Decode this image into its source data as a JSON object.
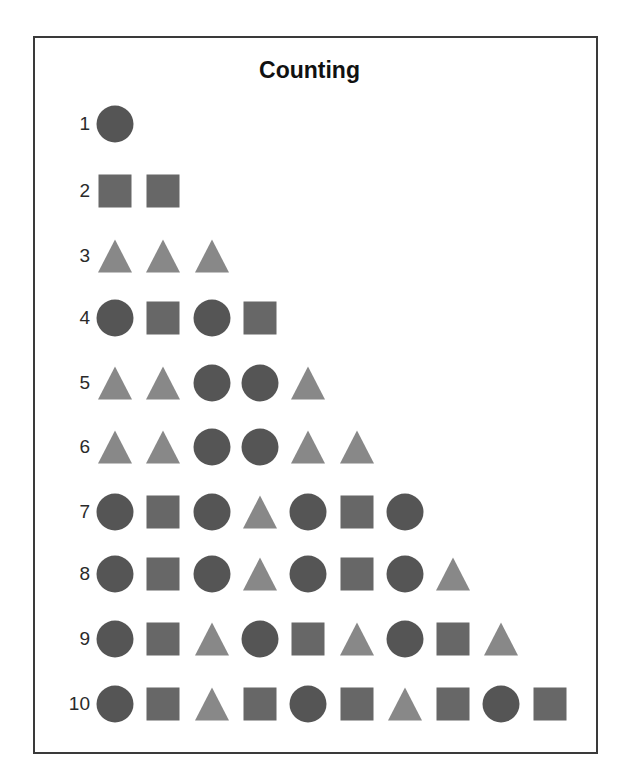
{
  "title": "Counting",
  "colors": {
    "circle": "#555555",
    "square": "#676767",
    "triangle": "#888888",
    "border": "#3a3a3a",
    "text": "#2a2a2a"
  },
  "layout": {
    "first_col_center_x": 115,
    "col_pitch": 48.3,
    "row_centers_y": [
      124,
      191,
      256,
      318,
      383,
      447,
      512,
      574,
      639,
      704
    ]
  },
  "rows": [
    {
      "label": "1",
      "shapes": [
        "circle"
      ]
    },
    {
      "label": "2",
      "shapes": [
        "square",
        "square"
      ]
    },
    {
      "label": "3",
      "shapes": [
        "triangle",
        "triangle",
        "triangle"
      ]
    },
    {
      "label": "4",
      "shapes": [
        "circle",
        "square",
        "circle",
        "square"
      ]
    },
    {
      "label": "5",
      "shapes": [
        "triangle",
        "triangle",
        "circle",
        "circle",
        "triangle"
      ]
    },
    {
      "label": "6",
      "shapes": [
        "triangle",
        "triangle",
        "circle",
        "circle",
        "triangle",
        "triangle"
      ]
    },
    {
      "label": "7",
      "shapes": [
        "circle",
        "square",
        "circle",
        "triangle",
        "circle",
        "square",
        "circle"
      ]
    },
    {
      "label": "8",
      "shapes": [
        "circle",
        "square",
        "circle",
        "triangle",
        "circle",
        "square",
        "circle",
        "triangle"
      ]
    },
    {
      "label": "9",
      "shapes": [
        "circle",
        "square",
        "triangle",
        "circle",
        "square",
        "triangle",
        "circle",
        "square",
        "triangle"
      ]
    },
    {
      "label": "10",
      "shapes": [
        "circle",
        "square",
        "triangle",
        "square",
        "circle",
        "square",
        "triangle",
        "square",
        "circle",
        "square"
      ]
    }
  ]
}
